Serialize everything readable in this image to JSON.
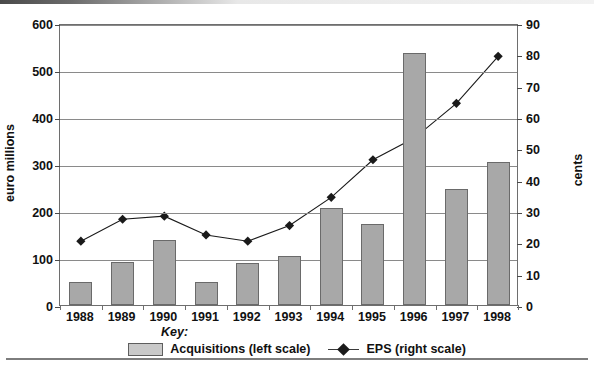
{
  "figure": {
    "left_axis_title": "euro millions",
    "right_axis_title": "cents",
    "key_label": "Key:"
  },
  "legend": {
    "entries": [
      {
        "label": "Acquisitions (left scale)",
        "marker": "bar-swatch",
        "color": "#a8a8a8"
      },
      {
        "label": "EPS (right scale)",
        "marker": "line-diamond-marker",
        "color": "#1a1a1a"
      }
    ]
  },
  "axes": {
    "left_ticks": [
      "0",
      "100",
      "200",
      "300",
      "400",
      "500",
      "600"
    ],
    "right_ticks": [
      "0",
      "10",
      "20",
      "30",
      "40",
      "50",
      "60",
      "70",
      "80",
      "90"
    ],
    "x_ticks": [
      "1988",
      "1989",
      "1990",
      "1991",
      "1992",
      "1993",
      "1994",
      "1995",
      "1996",
      "1997",
      "1998"
    ]
  },
  "chart_data": {
    "type": "bar",
    "title": "",
    "xlabel": "",
    "ylabel": "euro millions",
    "y2label": "cents",
    "ylim": [
      0,
      600
    ],
    "y2lim": [
      0,
      90
    ],
    "grid": true,
    "legend_position": "bottom-center",
    "categories": [
      "1988",
      "1989",
      "1990",
      "1991",
      "1992",
      "1993",
      "1994",
      "1995",
      "1996",
      "1997",
      "1998"
    ],
    "series": [
      {
        "name": "Acquisitions (left scale)",
        "type": "bar",
        "axis": "left",
        "unit": "euro millions",
        "color": "#a8a8a8",
        "values": [
          48,
          92,
          138,
          48,
          90,
          105,
          207,
          172,
          537,
          247,
          305
        ]
      },
      {
        "name": "EPS (right scale)",
        "type": "line",
        "axis": "right",
        "unit": "cents",
        "color": "#1a1a1a",
        "marker": "diamond",
        "values": [
          21,
          28,
          29,
          23,
          21,
          26,
          35,
          47,
          54,
          65,
          80
        ]
      }
    ]
  }
}
